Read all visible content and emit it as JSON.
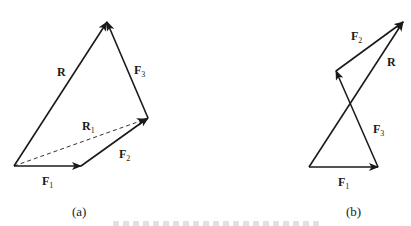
{
  "figure": {
    "panel_a": {
      "caption": "(a)",
      "vectors": [
        {
          "name": "F1",
          "from": [
            14,
            166
          ],
          "to": [
            81,
            166
          ],
          "style": "solid"
        },
        {
          "name": "F2",
          "from": [
            81,
            166
          ],
          "to": [
            148,
            118
          ],
          "style": "solid"
        },
        {
          "name": "F3",
          "from": [
            148,
            118
          ],
          "to": [
            107,
            22
          ],
          "style": "solid"
        },
        {
          "name": "R",
          "from": [
            14,
            166
          ],
          "to": [
            107,
            22
          ],
          "style": "solid"
        },
        {
          "name": "R1",
          "from": [
            14,
            166
          ],
          "to": [
            148,
            118
          ],
          "style": "dashed"
        }
      ],
      "labels": {
        "R": {
          "main": "R",
          "sub": ""
        },
        "F3": {
          "main": "F",
          "sub": "3"
        },
        "R1": {
          "main": "R",
          "sub": "1"
        },
        "F2": {
          "main": "F",
          "sub": "2"
        },
        "F1": {
          "main": "F",
          "sub": "1"
        }
      }
    },
    "panel_b": {
      "caption": "(b)",
      "vectors": [
        {
          "name": "F1",
          "from": [
            309,
            167
          ],
          "to": [
            378,
            167
          ],
          "style": "solid"
        },
        {
          "name": "F3",
          "from": [
            378,
            167
          ],
          "to": [
            336,
            71
          ],
          "style": "solid"
        },
        {
          "name": "F2",
          "from": [
            336,
            71
          ],
          "to": [
            403,
            22
          ],
          "style": "solid"
        },
        {
          "name": "R",
          "from": [
            309,
            167
          ],
          "to": [
            403,
            22
          ],
          "style": "solid"
        }
      ],
      "labels": {
        "F2": {
          "main": "F",
          "sub": "2"
        },
        "R": {
          "main": "R",
          "sub": ""
        },
        "F3": {
          "main": "F",
          "sub": "3"
        },
        "F1": {
          "main": "F",
          "sub": "1"
        }
      }
    },
    "colors": {
      "ink": "#1a1a1a",
      "background": "#ffffff"
    }
  }
}
